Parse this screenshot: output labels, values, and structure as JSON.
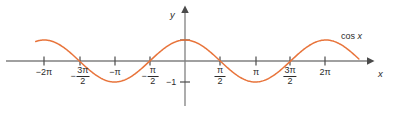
{
  "figure": {
    "title": "",
    "background_color": "#ffffff",
    "curve_color": "#E8743B",
    "axis_color": "#808080",
    "text_color": "#2b2b2b"
  },
  "axes": {
    "x_axis_label": "x",
    "y_axis_label": "y",
    "x_origin_px": 185,
    "y_origin_px": 61,
    "px_per_half_pi": 35.2,
    "amplitude_px": 21
  },
  "curve_label": {
    "text": "cos x",
    "func": "cos",
    "var": "x"
  },
  "y_ticks": [
    {
      "value": 1,
      "label": "",
      "show_label": false
    },
    {
      "value": -1,
      "label": "−1",
      "show_label": true
    }
  ],
  "x_ticks": [
    {
      "value_pi": -2,
      "type": "plain",
      "label": "−2π",
      "x_px": 44
    },
    {
      "value_pi": -1.5,
      "type": "fraction",
      "sign": "−",
      "numerator": "3π",
      "denominator": "2",
      "x_px": 80
    },
    {
      "value_pi": -1,
      "type": "plain",
      "label": "−π",
      "x_px": 115
    },
    {
      "value_pi": -0.5,
      "type": "fraction",
      "sign": "−",
      "numerator": "π",
      "denominator": "2",
      "x_px": 150
    },
    {
      "value_pi": 0.5,
      "type": "fraction",
      "sign": "",
      "numerator": "π",
      "denominator": "2",
      "x_px": 220
    },
    {
      "value_pi": 1,
      "type": "plain",
      "label": "π",
      "x_px": 256
    },
    {
      "value_pi": 1.5,
      "type": "fraction",
      "sign": "",
      "numerator": "3π",
      "denominator": "2",
      "x_px": 290
    },
    {
      "value_pi": 2,
      "type": "plain",
      "label": "2π",
      "x_px": 325
    }
  ],
  "chart_data": {
    "type": "line",
    "title": "",
    "xlabel": "x",
    "ylabel": "y",
    "function": "y = cos(x)",
    "series": [
      {
        "name": "cos x",
        "color": "#E8743B",
        "x_domain_pi": [
          -2.12,
          2.47
        ],
        "points_pi": [
          {
            "x_pi": -2.12,
            "y": 0.93
          },
          {
            "x_pi": -2.0,
            "y": 1.0
          },
          {
            "x_pi": -1.75,
            "y": 0.71
          },
          {
            "x_pi": -1.5,
            "y": 0.0
          },
          {
            "x_pi": -1.25,
            "y": -0.71
          },
          {
            "x_pi": -1.0,
            "y": -1.0
          },
          {
            "x_pi": -0.75,
            "y": -0.71
          },
          {
            "x_pi": -0.5,
            "y": 0.0
          },
          {
            "x_pi": -0.25,
            "y": 0.71
          },
          {
            "x_pi": 0.0,
            "y": 1.0
          },
          {
            "x_pi": 0.25,
            "y": 0.71
          },
          {
            "x_pi": 0.5,
            "y": 0.0
          },
          {
            "x_pi": 0.75,
            "y": -0.71
          },
          {
            "x_pi": 1.0,
            "y": -1.0
          },
          {
            "x_pi": 1.25,
            "y": -0.71
          },
          {
            "x_pi": 1.5,
            "y": 0.0
          },
          {
            "x_pi": 1.75,
            "y": 0.71
          },
          {
            "x_pi": 2.0,
            "y": 1.0
          },
          {
            "x_pi": 2.25,
            "y": 0.71
          },
          {
            "x_pi": 2.47,
            "y": 0.09
          }
        ]
      }
    ],
    "xlim_pi": [
      -2.6,
      2.9
    ],
    "ylim": [
      -1.6,
      1.45
    ],
    "grid": false,
    "legend": "inline-label",
    "xtick_labels": [
      "−2π",
      "−3π/2",
      "−π",
      "−π/2",
      "π/2",
      "π",
      "3π/2",
      "2π"
    ],
    "xtick_values_pi": [
      -2,
      -1.5,
      -1,
      -0.5,
      0.5,
      1,
      1.5,
      2
    ],
    "ytick_labels": [
      "−1"
    ],
    "ytick_values": [
      -1
    ]
  }
}
